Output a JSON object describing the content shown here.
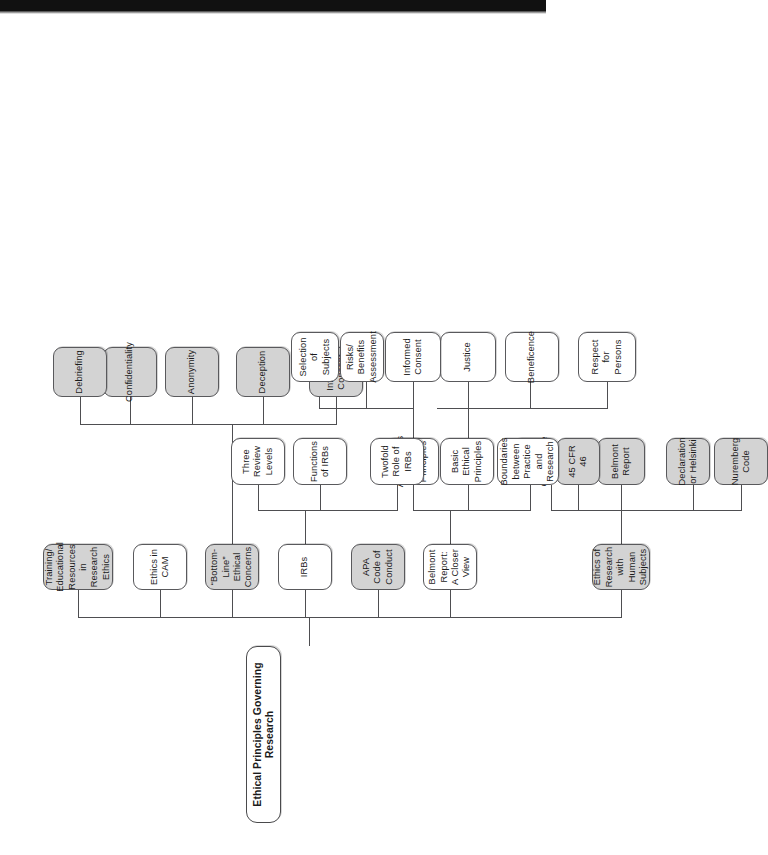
{
  "document": {
    "title": "Ethical Principles Governing Research",
    "orientation": "rotated-90-counterclockwise",
    "kind": "hierarchy concept map"
  },
  "colors": {
    "shaded_fill": "#d3d3d3",
    "plain_fill": "#ffffff",
    "border": "#59595c",
    "text": "#1b1b1b",
    "connector": "#4e4e51",
    "scan_bar": "#111111"
  },
  "root": {
    "label": "Ethical Principles Governing Research"
  },
  "level1": [
    {
      "id": "ethics-human-subjects",
      "label": "Ethics of Research with Human Subjects",
      "shaded": true
    },
    {
      "id": "belmont-closer-view",
      "label": "Belmont Report: A Closer View",
      "shaded": false
    },
    {
      "id": "apa-code",
      "label": "APA Code of Conduct",
      "shaded": true
    },
    {
      "id": "irbs",
      "label": "IRBs",
      "shaded": false
    },
    {
      "id": "bottom-line",
      "label": "“Bottom-Line” Ethical Concerns",
      "shaded": true
    },
    {
      "id": "ethics-cam",
      "label": "Ethics in CAM",
      "shaded": false
    },
    {
      "id": "training-resources",
      "label": "Training/ Educational Resources in Research Ethics",
      "shaded": true
    }
  ],
  "level2": {
    "ethics_human_subjects": [
      {
        "id": "nuremberg",
        "label": "Nuremberg Code",
        "shaded": true
      },
      {
        "id": "helsinki",
        "label": "Declaration or Helsinki",
        "shaded": true
      },
      {
        "id": "belmont-report",
        "label": "Belmont Report",
        "shaded": true
      },
      {
        "id": "cfr46",
        "label": "45 CFR 46",
        "shaded": true
      },
      {
        "id": "assurance",
        "label": "Assurance of Compliance",
        "shaded": true
      }
    ],
    "belmont_closer_view": [
      {
        "id": "boundaries",
        "label": "Boundaries between Practice and Research",
        "shaded": false
      },
      {
        "id": "basic-principles",
        "label": "Basic Ethical Principles",
        "shaded": false
      },
      {
        "id": "applications",
        "label": "Applications of the Principles",
        "shaded": false
      }
    ],
    "irbs": [
      {
        "id": "twofold-role",
        "label": "Twofold Role of IRBs",
        "shaded": false
      },
      {
        "id": "functions",
        "label": "Functions of IRBs",
        "shaded": false
      },
      {
        "id": "three-review",
        "label": "Three Review Levels",
        "shaded": false
      }
    ],
    "bottom_line": [
      {
        "id": "informed-consent-bl",
        "label": "Informed Consent",
        "shaded": true
      },
      {
        "id": "deception",
        "label": "Deception",
        "shaded": true
      },
      {
        "id": "anonymity",
        "label": "Anonymity",
        "shaded": true
      },
      {
        "id": "confidentiality",
        "label": "Confidentiality",
        "shaded": true
      },
      {
        "id": "debriefing",
        "label": "Debriefing",
        "shaded": true
      }
    ]
  },
  "level3": {
    "basic_principles": [
      {
        "id": "respect-persons",
        "label": "Respect for Persons",
        "shaded": false
      },
      {
        "id": "beneficence",
        "label": "Beneficence",
        "shaded": false
      },
      {
        "id": "justice",
        "label": "Justice",
        "shaded": false
      }
    ],
    "applications": [
      {
        "id": "informed-consent-app",
        "label": "Informed Consent",
        "shaded": false
      },
      {
        "id": "risks-benefits",
        "label": "Risks/ Benefits Assessment",
        "shaded": false
      },
      {
        "id": "selection-subjects",
        "label": "Selection of Subjects",
        "shaded": false
      }
    ]
  }
}
